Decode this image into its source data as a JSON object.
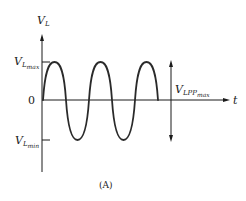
{
  "figure": {
    "caption": "(A)",
    "y_axis": {
      "label_main": "V",
      "label_sub": "L"
    },
    "x_axis": {
      "label": "t"
    },
    "levels": {
      "max": {
        "main": "V",
        "sub": "L",
        "subsub": "max"
      },
      "zero": "0",
      "min": {
        "main": "V",
        "sub": "L",
        "subsub": "min"
      }
    },
    "peak_to_peak": {
      "main": "V",
      "sub": "LPP",
      "subsub": "max"
    },
    "waveform": {
      "type": "sine",
      "cycles_shown": 2.5,
      "stroke_color": "#2a2a2a"
    }
  }
}
